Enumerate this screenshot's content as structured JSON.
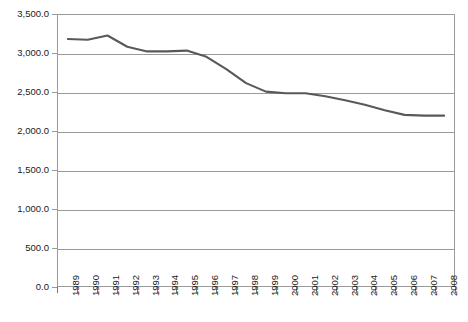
{
  "chart_data": {
    "type": "line",
    "title": "",
    "subtitle": "",
    "xlabel": "",
    "ylabel": "",
    "categories": [
      "1989",
      "1990",
      "1991",
      "1992",
      "1993",
      "1994",
      "1995",
      "1996",
      "1997",
      "1998",
      "1999",
      "2000",
      "2001",
      "2002",
      "2003",
      "2004",
      "2005",
      "2006",
      "2007",
      "2008"
    ],
    "values": [
      3190,
      3180,
      3235,
      3090,
      3030,
      3030,
      3040,
      2960,
      2800,
      2620,
      2510,
      2490,
      2490,
      2450,
      2400,
      2340,
      2270,
      2210,
      2200,
      2200
    ],
    "series": [
      {
        "name": "Series 1",
        "values": [
          3190,
          3180,
          3235,
          3090,
          3030,
          3030,
          3040,
          2960,
          2800,
          2620,
          2510,
          2490,
          2490,
          2450,
          2400,
          2340,
          2270,
          2210,
          2200,
          2200
        ],
        "color": "#595959"
      }
    ],
    "ylim": [
      0,
      3500
    ],
    "ytick_values": [
      0,
      500,
      1000,
      1500,
      2000,
      2500,
      3000,
      3500
    ],
    "ytick_labels": [
      "0.0",
      "500.0",
      "1,000.0",
      "1,500.0",
      "2,000.0",
      "2,500.0",
      "3,000.0",
      "3,500.0"
    ],
    "grid": true,
    "grid_axis": "y",
    "legend": false,
    "legend_position": "none",
    "markers": false,
    "xtick_rotation": -90,
    "annotations": []
  },
  "style": {
    "line_color": "#595959",
    "grid_color": "#9a9a9a",
    "axis_color": "#9a9a9a",
    "text_color": "#1a1a1a",
    "background": "#ffffff",
    "line_width": 2.1
  }
}
